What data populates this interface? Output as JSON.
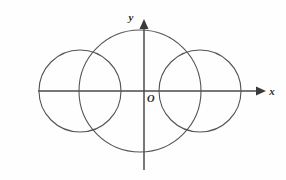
{
  "figure": {
    "background_color": "#fefefe",
    "axis_color": "#4a4a4a",
    "curve_color": "#555555",
    "label_color": "#2b2b2b",
    "width": 286,
    "height": 180
  },
  "labels": {
    "x_axis": "x",
    "y_axis": "y",
    "origin": "O"
  },
  "chart_data": {
    "type": "scatter",
    "title": "",
    "xlabel": "x",
    "ylabel": "y",
    "grid": false,
    "legend": "none",
    "origin_label": "O",
    "origin_px": [
      144,
      91
    ],
    "xlim_px": [
      38,
      266
    ],
    "ylim_px": [
      19,
      170
    ],
    "axes": [
      {
        "name": "x-axis",
        "orientation": "horizontal",
        "start_px": [
          38,
          91
        ],
        "end_px": [
          266,
          91
        ],
        "arrow_at": "end",
        "label": "x",
        "label_px": [
          270,
          94
        ]
      },
      {
        "name": "y-axis",
        "orientation": "vertical",
        "start_px": [
          144,
          170
        ],
        "end_px": [
          144,
          19
        ],
        "arrow_at": "end",
        "label": "y",
        "label_px": [
          134,
          19
        ]
      }
    ],
    "shapes": [
      {
        "name": "left-circle",
        "type": "circle",
        "center_px": [
          80,
          91
        ],
        "radius_px": 41,
        "center_units": [
          -2,
          0
        ],
        "radius_units": 1
      },
      {
        "name": "middle-circle",
        "type": "circle",
        "center_px": [
          140,
          91
        ],
        "radius_px": 61,
        "center_units": [
          -0.1,
          0
        ],
        "radius_units": 1.5
      },
      {
        "name": "right-circle",
        "type": "circle",
        "center_px": [
          200,
          91
        ],
        "radius_px": 41,
        "center_units": [
          1.9,
          0
        ],
        "radius_units": 1
      }
    ]
  }
}
